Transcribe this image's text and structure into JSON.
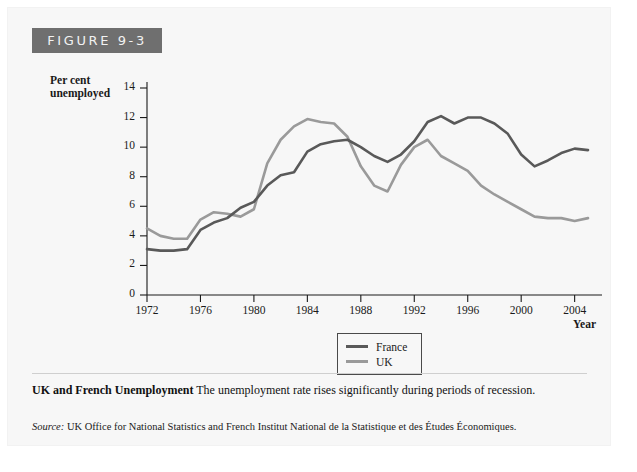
{
  "figure": {
    "banner_label": "FIGURE 9-3",
    "caption_title": "UK and French Unemployment",
    "caption_body": " The unemployment rate rises significantly during periods of recession.",
    "source_label": "Source:",
    "source_body": " UK Office for National Statistics and French Institut National de la Statistique et des Études Économiques."
  },
  "colors": {
    "france_line": "#595959",
    "uk_line": "#9a9a9a",
    "axis": "#1a1a1a",
    "banner_bg": "#6f6f6f",
    "card_bg": "#f7f7f7"
  },
  "chart_data": {
    "type": "line",
    "title": "",
    "xlabel": "Year",
    "ylabel": "Per cent unemployed",
    "xlim": [
      1972,
      2005
    ],
    "ylim": [
      0,
      14
    ],
    "ytick_values": [
      0,
      2,
      4,
      6,
      8,
      10,
      12,
      14
    ],
    "ytick_labels": [
      "0",
      "2",
      "4",
      "6",
      "8",
      "10",
      "12",
      "14"
    ],
    "xtick_values": [
      1972,
      1976,
      1980,
      1984,
      1988,
      1992,
      1996,
      2000,
      2004
    ],
    "xtick_labels": [
      "1972",
      "1976",
      "1980",
      "1984",
      "1988",
      "1992",
      "1996",
      "2000",
      "2004"
    ],
    "grid": false,
    "legend_position": "bottom-center",
    "x": [
      1972,
      1973,
      1974,
      1975,
      1976,
      1977,
      1978,
      1979,
      1980,
      1981,
      1982,
      1983,
      1984,
      1985,
      1986,
      1987,
      1988,
      1989,
      1990,
      1991,
      1992,
      1993,
      1994,
      1995,
      1996,
      1997,
      1998,
      1999,
      2000,
      2001,
      2002,
      2003,
      2004,
      2005
    ],
    "series": [
      {
        "name": "France",
        "color": "#595959",
        "values": [
          3.1,
          3.0,
          3.0,
          3.1,
          4.4,
          4.9,
          5.2,
          5.9,
          6.3,
          7.4,
          8.1,
          8.3,
          9.7,
          10.2,
          10.4,
          10.5,
          10.0,
          9.4,
          9.0,
          9.5,
          10.4,
          11.7,
          12.1,
          11.6,
          12.0,
          12.0,
          11.6,
          10.9,
          9.5,
          8.7,
          9.1,
          9.6,
          9.9,
          9.8
        ]
      },
      {
        "name": "UK",
        "color": "#9a9a9a",
        "values": [
          4.5,
          4.0,
          3.8,
          3.8,
          5.1,
          5.6,
          5.5,
          5.3,
          5.8,
          8.9,
          10.5,
          11.4,
          11.9,
          11.7,
          11.6,
          10.7,
          8.7,
          7.4,
          7.0,
          8.8,
          10.0,
          10.5,
          9.4,
          8.9,
          8.4,
          7.4,
          6.8,
          6.3,
          5.8,
          5.3,
          5.2,
          5.2,
          5.0,
          5.2
        ]
      }
    ]
  }
}
